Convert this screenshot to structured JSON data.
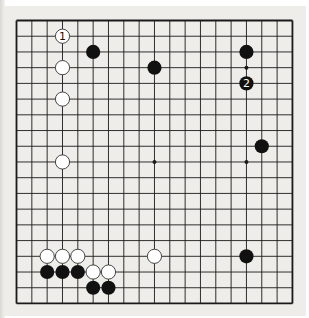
{
  "diagram": {
    "type": "go-board",
    "size": 19,
    "colors": {
      "paper": "#eeede9",
      "line": "#1a1a1a",
      "black": "#111111",
      "white": "#ffffff"
    },
    "grid": {
      "x0": 16.5,
      "y0": 20.5,
      "dx": 15.33,
      "dy": 15.72
    },
    "star_points": [
      [
        3,
        3
      ],
      [
        9,
        3
      ],
      [
        15,
        3
      ],
      [
        3,
        9
      ],
      [
        9,
        9
      ],
      [
        15,
        9
      ],
      [
        3,
        15
      ],
      [
        9,
        15
      ],
      [
        15,
        15
      ]
    ],
    "stones": [
      {
        "color": "white",
        "col": 3,
        "row": 1,
        "label": "1"
      },
      {
        "color": "black",
        "col": 5,
        "row": 2
      },
      {
        "color": "white",
        "col": 3,
        "row": 3
      },
      {
        "color": "black",
        "col": 9,
        "row": 3
      },
      {
        "color": "black",
        "col": 15,
        "row": 2
      },
      {
        "color": "black",
        "col": 15,
        "row": 4,
        "label": "2"
      },
      {
        "color": "white",
        "col": 3,
        "row": 5
      },
      {
        "color": "black",
        "col": 16,
        "row": 8
      },
      {
        "color": "white",
        "col": 3,
        "row": 9
      },
      {
        "color": "white",
        "col": 2,
        "row": 15
      },
      {
        "color": "white",
        "col": 3,
        "row": 15
      },
      {
        "color": "white",
        "col": 4,
        "row": 15
      },
      {
        "color": "white",
        "col": 9,
        "row": 15
      },
      {
        "color": "black",
        "col": 15,
        "row": 15
      },
      {
        "color": "black",
        "col": 2,
        "row": 16
      },
      {
        "color": "black",
        "col": 3,
        "row": 16
      },
      {
        "color": "black",
        "col": 4,
        "row": 16
      },
      {
        "color": "white",
        "col": 5,
        "row": 16
      },
      {
        "color": "white",
        "col": 6,
        "row": 16
      },
      {
        "color": "black",
        "col": 5,
        "row": 17
      },
      {
        "color": "black",
        "col": 6,
        "row": 17
      }
    ]
  }
}
